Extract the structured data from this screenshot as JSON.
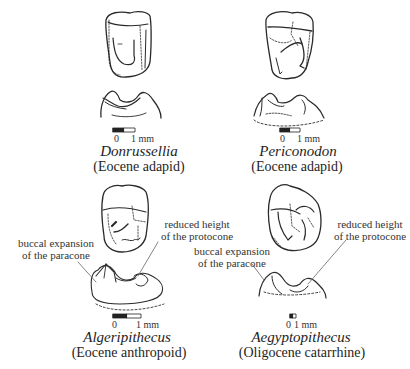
{
  "figure": {
    "panels": [
      {
        "id": "donrussellia",
        "species": "Donrussellia",
        "group": "(Eocene adapid)",
        "scale": {
          "zero": "0",
          "one": "1 mm"
        }
      },
      {
        "id": "periconodon",
        "species": "Periconodon",
        "group": "(Eocene adapid)",
        "scale": {
          "zero": "0",
          "one": "1 mm"
        }
      },
      {
        "id": "algeripithecus",
        "species": "Algeripithecus",
        "group": "(Eocene anthropoid)",
        "scale": {
          "zero": "0",
          "one": "1 mm"
        },
        "annotations": {
          "left_line1": "buccal expansion",
          "left_line2": "of the paracone",
          "right_line1": "reduced height",
          "right_line2": "of the protocone"
        }
      },
      {
        "id": "aegyptopithecus",
        "species": "Aegyptopithecus",
        "group": "(Oligocene  catarrhine)",
        "scale": {
          "zero": "0",
          "one": "1 mm"
        },
        "annotations": {
          "left_line1": "buccal expansion",
          "left_line2": "of the paracone",
          "right_line1": "reduced height",
          "right_line2": "of the protocone"
        }
      }
    ],
    "colors": {
      "ink": "#2a2a2a",
      "background": "#ffffff"
    }
  }
}
